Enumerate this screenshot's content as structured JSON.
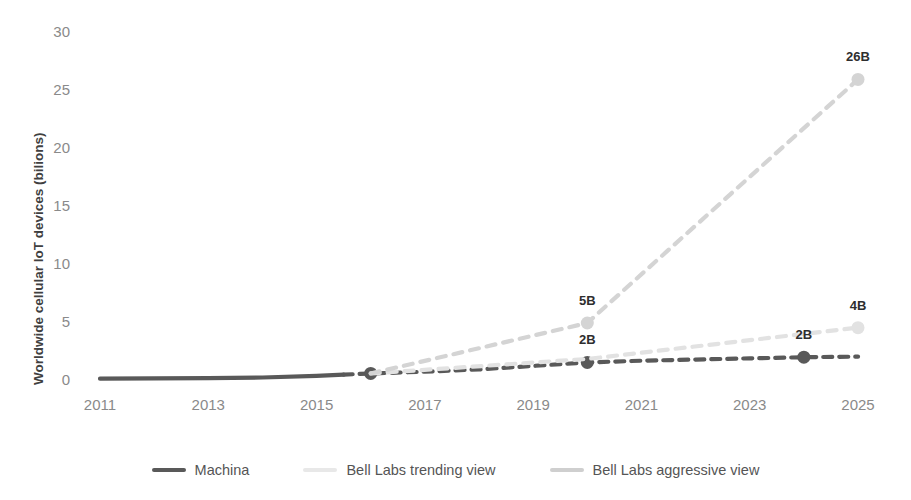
{
  "chart_data": {
    "type": "line",
    "title": "",
    "xlabel": "",
    "ylabel": "Worldwide cellular IoT devices (bilions)",
    "xlim": [
      2011,
      2025
    ],
    "ylim": [
      0,
      30
    ],
    "yticks": [
      "0",
      "5",
      "10",
      "15",
      "20",
      "25",
      "30"
    ],
    "xticks": [
      "2011",
      "2013",
      "2015",
      "2017",
      "2019",
      "2021",
      "2023",
      "2025"
    ],
    "grid": false,
    "legend_position": "bottom",
    "series": [
      {
        "name": "Machina",
        "color": "#595959",
        "style_solid_until": 2015.5,
        "x": [
          2011,
          2012,
          2013,
          2014,
          2015,
          2016,
          2017,
          2018,
          2019,
          2020,
          2021,
          2022,
          2023,
          2024,
          2025
        ],
        "values": [
          0.2,
          0.22,
          0.25,
          0.3,
          0.45,
          0.65,
          0.8,
          1.0,
          1.3,
          1.6,
          1.75,
          1.85,
          1.95,
          2.05,
          2.1
        ],
        "labels": [
          {
            "x": 2020,
            "value": 1.6,
            "text": "2B"
          },
          {
            "x": 2024,
            "value": 2.05,
            "text": "2B"
          }
        ],
        "markers": [
          {
            "x": 2016,
            "value": 0.65
          },
          {
            "x": 2020,
            "value": 1.6
          },
          {
            "x": 2024,
            "value": 2.05
          }
        ]
      },
      {
        "name": "Bell Labs trending view",
        "color": "#e2e2e2",
        "x": [
          2016,
          2020,
          2025
        ],
        "values": [
          0.65,
          1.9,
          4.6
        ],
        "labels": [
          {
            "x": 2025,
            "value": 4.6,
            "text": "4B"
          }
        ],
        "markers": [
          {
            "x": 2025,
            "value": 4.6
          }
        ]
      },
      {
        "name": "Bell Labs aggressive view",
        "color": "#d4d4d4",
        "x": [
          2016,
          2020,
          2025
        ],
        "values": [
          0.65,
          5.0,
          26.0
        ],
        "labels": [
          {
            "x": 2020,
            "value": 5.0,
            "text": "5B"
          },
          {
            "x": 2025,
            "value": 26.0,
            "text": "26B"
          }
        ],
        "markers": [
          {
            "x": 2020,
            "value": 5.0
          },
          {
            "x": 2025,
            "value": 26.0
          }
        ]
      }
    ]
  },
  "legend": {
    "items": [
      {
        "label": "Machina",
        "color": "#595959"
      },
      {
        "label": "Bell Labs trending view",
        "color": "#e8e8e8"
      },
      {
        "label": "Bell Labs aggressive view",
        "color": "#cfcfcf"
      }
    ]
  }
}
